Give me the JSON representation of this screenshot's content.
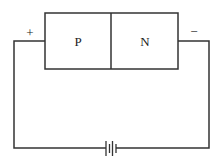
{
  "diagram": {
    "regions": [
      {
        "label": "P"
      },
      {
        "label": "N"
      }
    ],
    "terminals": {
      "left": "+",
      "right": "−"
    },
    "battery": {
      "cells": 2
    }
  }
}
